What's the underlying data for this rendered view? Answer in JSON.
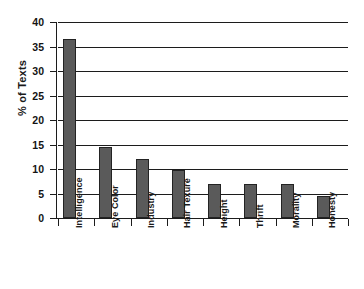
{
  "chart_data": {
    "type": "bar",
    "title": "",
    "subtitle": "",
    "xlabel": "",
    "ylabel": "% of Texts",
    "ylim": [
      0,
      40
    ],
    "yticks": [
      0,
      5,
      10,
      15,
      20,
      25,
      30,
      35,
      40
    ],
    "ytick_labels": [
      "0",
      "5",
      "10",
      "15",
      "20",
      "25",
      "30",
      "35",
      "40"
    ],
    "grid": "horizontal",
    "legend": "none",
    "bar_color": "#5a5a5a",
    "bar_edge_color": "#232323",
    "axis_color": "#1c1c1c",
    "categories": [
      "Intelligence",
      "Eye Color",
      "Industry",
      "Hair Texure",
      "Height",
      "Thrift",
      "Morality",
      "Honesty"
    ],
    "values": [
      36.5,
      14.5,
      12.0,
      9.7,
      7.0,
      7.0,
      6.9,
      4.5
    ]
  }
}
